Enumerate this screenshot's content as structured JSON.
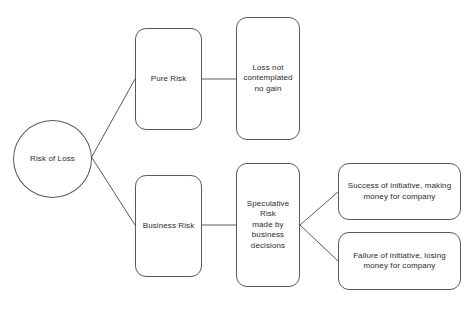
{
  "diagram": {
    "title": "Risk of Loss",
    "background_color": "#ffffff",
    "stroke_color": "#5a5a5a",
    "text_color": "#2b2b2b",
    "nodes": {
      "root": {
        "label": "Risk of Loss",
        "shape": "circle"
      },
      "pure_risk": {
        "label": "Pure Risk",
        "shape": "rounded-rect"
      },
      "loss_not_contemplated": {
        "label": "Loss not\ncontemplated\nno gain",
        "shape": "rounded-rect"
      },
      "business_risk": {
        "label": "Business Risk",
        "shape": "rounded-rect"
      },
      "speculative_risk": {
        "label": "Speculative\nRisk\nmade by\nbusiness\ndecisions",
        "shape": "rounded-rect"
      },
      "success": {
        "label": "Success of initiative, making\nmoney for company",
        "shape": "rounded-rect"
      },
      "failure": {
        "label": "Failure of initiative, losing\nmoney for company",
        "shape": "rounded-rect"
      }
    },
    "edges": [
      {
        "name": "root-to-pure-risk",
        "from": "root",
        "to": "pure_risk"
      },
      {
        "name": "root-to-business-risk",
        "from": "root",
        "to": "business_risk"
      },
      {
        "name": "pure-risk-to-loss-not-contemplated",
        "from": "pure_risk",
        "to": "loss_not_contemplated"
      },
      {
        "name": "business-risk-to-speculative-risk",
        "from": "business_risk",
        "to": "speculative_risk"
      },
      {
        "name": "speculative-risk-to-success",
        "from": "speculative_risk",
        "to": "success"
      },
      {
        "name": "speculative-risk-to-failure",
        "from": "speculative_risk",
        "to": "failure"
      }
    ]
  }
}
